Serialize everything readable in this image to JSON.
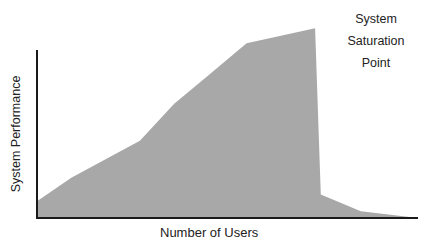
{
  "chart_data": {
    "type": "area",
    "title": "",
    "xlabel": "Number of Users",
    "ylabel": "System Performance",
    "annotations": [
      {
        "text": "System Saturation Point",
        "lines": [
          "System",
          "Saturation",
          "Point"
        ],
        "position": "top-right",
        "refers_to_x": 0.73
      }
    ],
    "grid": false,
    "legend": null,
    "ticks": {
      "x": [],
      "y": []
    },
    "xlim": [
      0,
      1
    ],
    "ylim": [
      0,
      1
    ],
    "x": [
      0.0,
      0.09,
      0.27,
      0.36,
      0.45,
      0.55,
      0.73,
      0.745,
      0.85,
      1.0
    ],
    "values": [
      0.1,
      0.24,
      0.46,
      0.68,
      0.85,
      1.04,
      1.13,
      0.14,
      0.04,
      0.0
    ],
    "series": [
      {
        "name": "System Performance",
        "color": "#a8a8a8",
        "x": [
          0.0,
          0.09,
          0.27,
          0.36,
          0.45,
          0.55,
          0.73,
          0.745,
          0.85,
          1.0
        ],
        "values": [
          0.1,
          0.24,
          0.46,
          0.68,
          0.85,
          1.04,
          1.13,
          0.14,
          0.04,
          0.0
        ]
      }
    ]
  },
  "labels": {
    "annotation_lines": [
      "System",
      "Saturation",
      "Point"
    ],
    "xlabel": "Number of Users",
    "ylabel": "System Performance"
  },
  "colors": {
    "fill": "#a8a8a8",
    "axis": "#1a1a1a",
    "text": "#222222"
  }
}
